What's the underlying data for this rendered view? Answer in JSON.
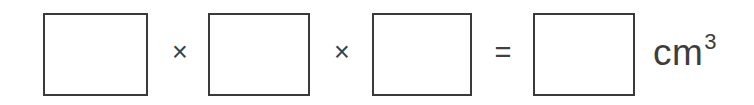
{
  "worksheet": {
    "equation": {
      "boxes": [
        {
          "id": "box-1",
          "name": "length-input",
          "value": "",
          "placeholder": ""
        },
        {
          "id": "box-2",
          "name": "width-input",
          "value": "",
          "placeholder": ""
        },
        {
          "id": "box-3",
          "name": "height-input",
          "value": "",
          "placeholder": ""
        },
        {
          "id": "box-4",
          "name": "volume-answer-input",
          "value": "",
          "placeholder": ""
        }
      ],
      "operators": [
        {
          "id": "operator-times-1",
          "symbol": "×",
          "name": "multiply-operator"
        },
        {
          "id": "operator-times-2",
          "symbol": "×",
          "name": "multiply-operator"
        },
        {
          "id": "operator-equals-1",
          "symbol": "=",
          "name": "equals-operator"
        }
      ],
      "unit": {
        "base": "cm",
        "exponent": "3"
      }
    },
    "colors": {
      "background": "#ffffff",
      "box_border": "#3a3a3a",
      "operator_text": "#404040",
      "unit_text": "#3d3d3d"
    }
  }
}
